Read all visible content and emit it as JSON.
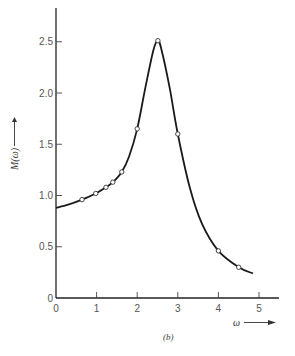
{
  "chart_data": {
    "type": "line",
    "title": "",
    "caption": "(b)",
    "xlabel": "ω",
    "ylabel": "M(ω)",
    "xlim": [
      0,
      5.4
    ],
    "ylim": [
      0,
      2.8
    ],
    "x_ticks": [
      0,
      1,
      2,
      3,
      4,
      5
    ],
    "x_tick_labels": [
      "0",
      "1",
      "2",
      "3",
      "4",
      "5"
    ],
    "y_ticks": [
      0,
      0.5,
      1.0,
      1.5,
      2.0,
      2.5
    ],
    "y_tick_labels": [
      "0",
      "0.5",
      "1.0",
      "1.5",
      "2.0",
      "2.5"
    ],
    "grid": false,
    "legend": null,
    "series": [
      {
        "name": "M(ω) curve",
        "style": "smooth-line",
        "x": [
          0,
          0.3,
          0.64,
          0.98,
          1.23,
          1.4,
          1.62,
          1.8,
          2.0,
          2.2,
          2.4,
          2.51,
          2.6,
          2.8,
          3.0,
          3.3,
          3.6,
          4.0,
          4.5,
          4.85
        ],
        "y": [
          0.88,
          0.91,
          0.96,
          1.02,
          1.08,
          1.13,
          1.23,
          1.38,
          1.65,
          2.05,
          2.42,
          2.51,
          2.42,
          2.05,
          1.6,
          1.07,
          0.72,
          0.46,
          0.3,
          0.24
        ]
      },
      {
        "name": "measured points",
        "style": "open-circle-markers",
        "x": [
          0.64,
          0.98,
          1.23,
          1.4,
          1.62,
          2.0,
          2.51,
          3.0,
          4.0,
          4.5
        ],
        "y": [
          0.96,
          1.02,
          1.08,
          1.13,
          1.23,
          1.65,
          2.51,
          1.6,
          0.46,
          0.3
        ]
      }
    ]
  },
  "labels": {
    "x_axis": "ω",
    "y_axis": "M(ω)",
    "caption": "(b)"
  }
}
